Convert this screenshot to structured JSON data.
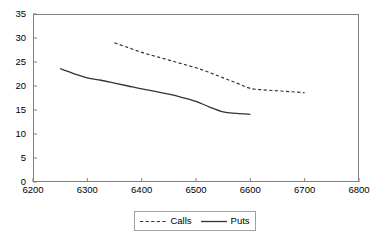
{
  "chart_data": {
    "type": "line",
    "title": "",
    "xlabel": "",
    "ylabel": "",
    "xlim": [
      6200,
      6800
    ],
    "ylim": [
      0,
      35
    ],
    "xticks": [
      6200,
      6300,
      6400,
      6500,
      6600,
      6700,
      6800
    ],
    "yticks": [
      0,
      5,
      10,
      15,
      20,
      25,
      30,
      35
    ],
    "grid": false,
    "legend_position": "bottom-center",
    "series": [
      {
        "name": "Calls",
        "style": "dashed",
        "color": "#333333",
        "x": [
          6350,
          6375,
          6400,
          6425,
          6450,
          6475,
          6500,
          6525,
          6550,
          6575,
          6600,
          6625,
          6650,
          6675,
          6700
        ],
        "values": [
          29.0,
          28.0,
          27.0,
          26.2,
          25.4,
          24.6,
          23.8,
          22.8,
          21.7,
          20.6,
          19.5,
          19.2,
          19.0,
          18.8,
          18.6
        ]
      },
      {
        "name": "Puts",
        "style": "solid",
        "color": "#333333",
        "x": [
          6250,
          6275,
          6300,
          6325,
          6350,
          6375,
          6400,
          6425,
          6450,
          6475,
          6500,
          6525,
          6550,
          6575,
          6600
        ],
        "values": [
          23.6,
          22.6,
          21.7,
          21.2,
          20.6,
          20.0,
          19.4,
          18.9,
          18.3,
          17.6,
          16.8,
          15.6,
          14.6,
          14.3,
          14.1
        ]
      }
    ]
  },
  "legend": {
    "items": [
      {
        "label": "Calls"
      },
      {
        "label": "Puts"
      }
    ]
  },
  "axes": {
    "x_tick_labels": [
      "6200",
      "6300",
      "6400",
      "6500",
      "6600",
      "6700",
      "6800"
    ],
    "y_tick_labels": [
      "0",
      "5",
      "10",
      "15",
      "20",
      "25",
      "30",
      "35"
    ]
  },
  "colors": {
    "frame": "#808080",
    "line": "#333333",
    "background": "#ffffff"
  }
}
